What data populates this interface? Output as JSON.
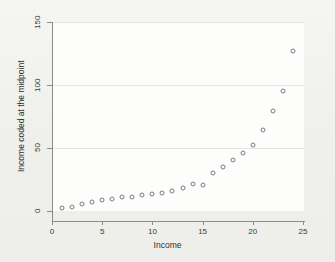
{
  "figure": {
    "background_color": "#f3f3f0",
    "plot_background_color": "#fdfdfc",
    "marker_color": "#7b7b84",
    "axis_color": "#8b8b8b",
    "grid_color": "#e6e6e4"
  },
  "chart_data": {
    "type": "scatter",
    "title": "",
    "xlabel": "Income",
    "ylabel": "Income coded at the midpoint",
    "xlim": [
      0,
      25
    ],
    "ylim": [
      0,
      150
    ],
    "xticks": [
      0,
      5,
      10,
      15,
      20,
      25
    ],
    "yticks": [
      0,
      50,
      100,
      150
    ],
    "xtick_labels": [
      "0",
      "5",
      "10",
      "15",
      "20",
      "25"
    ],
    "ytick_labels": [
      "0",
      "50",
      "100",
      "150"
    ],
    "grid": "horizontal",
    "legend": "none",
    "series": [
      {
        "name": "Income midpoint",
        "x": [
          1,
          2,
          3,
          4,
          5,
          6,
          7,
          8,
          9,
          10,
          11,
          12,
          13,
          14,
          15,
          16,
          17,
          18,
          19,
          20,
          21,
          22,
          23,
          24
        ],
        "y": [
          2,
          3.5,
          5.5,
          7,
          8.5,
          9.5,
          11,
          11.5,
          12.5,
          13.5,
          14,
          16,
          18.5,
          21.5,
          21,
          30,
          35,
          40.5,
          46,
          52,
          64,
          79.5,
          95,
          127
        ]
      }
    ]
  }
}
